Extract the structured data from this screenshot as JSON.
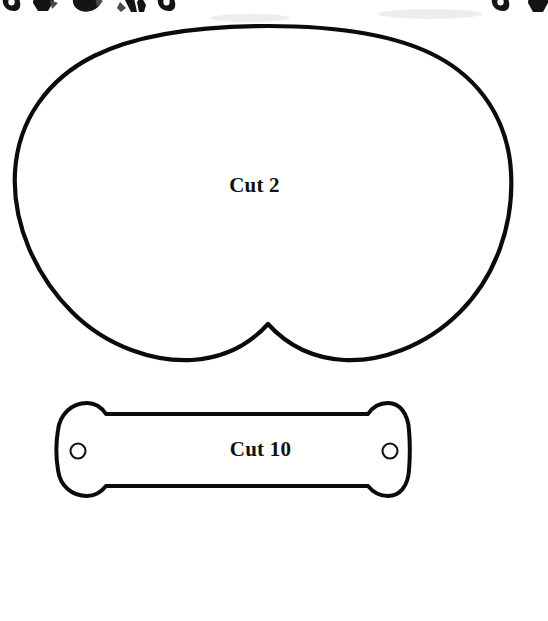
{
  "page": {
    "background_color": "#ffffff",
    "ink_color": "#0b0b0b",
    "width": 548,
    "height": 621
  },
  "pieces": [
    {
      "id": "cut2",
      "label": "Cut 2",
      "shape_name": "rounded-blob-with-bottom-notch",
      "description": "Large rounded body panel with a pointed notch at bottom center",
      "bounds": {
        "x": 13,
        "y": 26,
        "width": 499,
        "height": 336
      },
      "stroke_width": 4.2,
      "notch_peak": {
        "x": 268,
        "y": 324
      }
    },
    {
      "id": "cut10",
      "label": "Cut 10",
      "shape_name": "dogbone-strap",
      "description": "Bone shaped strap with flared rounded ends and a round hole in each end",
      "bounds": {
        "x": 57,
        "y": 402,
        "width": 352,
        "height": 94
      },
      "stroke_width": 4.0,
      "holes": [
        {
          "cx": 78,
          "cy": 451,
          "r": 7.5
        },
        {
          "cx": 390,
          "cy": 451,
          "r": 7.5
        }
      ]
    }
  ],
  "top_scraps": {
    "description": "Cropped bottom edges of clipart from the preceding page region",
    "count": 7,
    "items": [
      {
        "name": "scrap-blob-1",
        "x": 8,
        "y": 0,
        "w": 13,
        "h": 11
      },
      {
        "name": "scrap-blob-2",
        "x": 33,
        "y": 0,
        "w": 24,
        "h": 12
      },
      {
        "name": "scrap-blob-3",
        "x": 76,
        "y": 0,
        "w": 27,
        "h": 12
      },
      {
        "name": "scrap-blob-4",
        "x": 119,
        "y": 0,
        "w": 27,
        "h": 13
      },
      {
        "name": "scrap-blob-5",
        "x": 163,
        "y": 0,
        "w": 14,
        "h": 11
      },
      {
        "name": "scrap-blob-6",
        "x": 497,
        "y": 0,
        "w": 13,
        "h": 11
      },
      {
        "name": "scrap-blob-7",
        "x": 528,
        "y": 0,
        "w": 20,
        "h": 12
      }
    ]
  },
  "labels": {
    "cut2": "Cut 2",
    "cut10": "Cut 10"
  }
}
